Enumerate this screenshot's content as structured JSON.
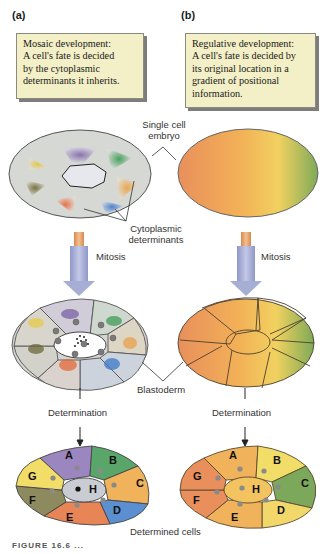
{
  "panels": {
    "a": {
      "label": "(a)",
      "note_lines": [
        "Mosaic development:",
        "A cell's fate is decided",
        "by the cytoplasmic",
        "determinants it inherits."
      ]
    },
    "b": {
      "label": "(b)",
      "note_lines": [
        "Regulative development:",
        "A cell's fate is decided by",
        "its original location in a",
        "gradient of positional",
        "information."
      ]
    }
  },
  "labels": {
    "single_cell": [
      "Single cell",
      "embryo"
    ],
    "cytoplasmic": [
      "Cytoplasmic",
      "determinants"
    ],
    "mitosis_a": "Mitosis",
    "mitosis_b": "Mitosis",
    "blastoderm": "Blastoderm",
    "determination_a": "Determination",
    "determination_b": "Determination",
    "determined_cells": "Determined cells"
  },
  "cells": [
    "A",
    "B",
    "C",
    "D",
    "E",
    "F",
    "G",
    "H"
  ],
  "caption": "FIGURE 16.6 ...",
  "colors": {
    "note_bg": "#f3efc6",
    "arrow_blue": "#a9b0d6",
    "arrow_orange": "#e9a76c",
    "purple": "#9b86c0",
    "green": "#5aa66a",
    "orange": "#f0b25a",
    "blue": "#5b8fd0",
    "red_orange": "#e88556",
    "olive": "#8d8a5f",
    "yellow": "#f2dd68",
    "grey": "#c9ccd2"
  }
}
